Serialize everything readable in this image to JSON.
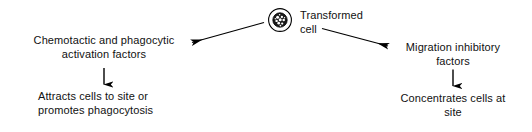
{
  "diagram": {
    "title_node": {
      "label": "Transformed\ncell",
      "icon": "transformed-cell-icon"
    },
    "branches": [
      {
        "id": "left",
        "factor_label": "Chemotactic and phagocytic\nactivation factors",
        "outcome_label": "Attracts cells to site or\npromotes phagocytosis",
        "branch_arrow": "arrow-left",
        "outcome_arrow": "arrow-down"
      },
      {
        "id": "right",
        "factor_label": "Migration inhibitory\nfactors",
        "outcome_label": "Concentrates cells at\nsite",
        "branch_arrow": "arrow-right",
        "outcome_arrow": "arrow-down"
      }
    ],
    "colors": {
      "background": "#ffffff",
      "ink": "#111111",
      "stroke": "#000000"
    }
  }
}
